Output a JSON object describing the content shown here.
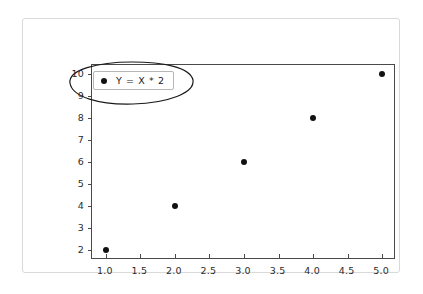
{
  "chart_data": {
    "type": "scatter",
    "title": "",
    "xlabel": "",
    "ylabel": "",
    "x": [
      1,
      2,
      3,
      4,
      5
    ],
    "values": [
      2,
      4,
      6,
      8,
      10
    ],
    "series": [
      {
        "name": "Y = X * 2",
        "x": [
          1,
          2,
          3,
          4,
          5
        ],
        "values": [
          2,
          4,
          6,
          8,
          10
        ]
      }
    ],
    "xlim": [
      0.8,
      5.2
    ],
    "ylim": [
      1.55,
      10.4
    ],
    "xticks": [
      1.0,
      1.5,
      2.0,
      2.5,
      3.0,
      3.5,
      4.0,
      4.5,
      5.0
    ],
    "xtick_labels": [
      "1.0",
      "1.5",
      "2.0",
      "2.5",
      "3.0",
      "3.5",
      "4.0",
      "4.5",
      "5.0"
    ],
    "yticks": [
      2,
      3,
      4,
      5,
      6,
      7,
      8,
      9,
      10
    ],
    "ytick_labels": [
      "2",
      "3",
      "4",
      "5",
      "6",
      "7",
      "8",
      "9",
      "10"
    ],
    "grid": false,
    "legend_position": "upper left",
    "marker_color": "#111111",
    "axes_color": "#4a4a4a",
    "frame_color": "#d9d9d9",
    "background_color": "#ffffff"
  },
  "legend": {
    "label": "Y = X * 2"
  },
  "annotation": {
    "shape": "ellipse",
    "color": "#1a1a1a",
    "target": "legend"
  }
}
